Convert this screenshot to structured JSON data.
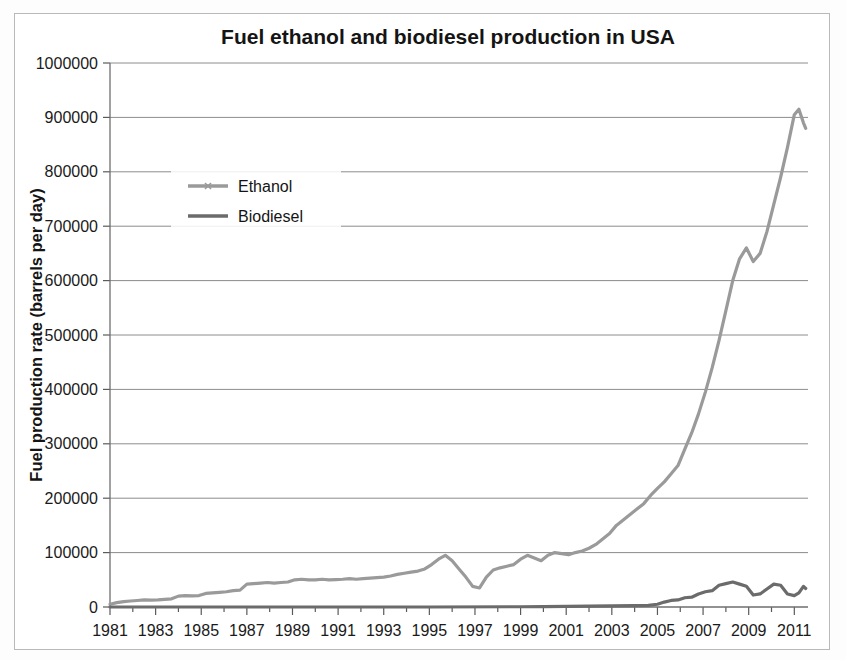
{
  "chart_data": {
    "type": "line",
    "title": "Fuel ethanol and biodiesel production in  USA",
    "xlabel": "",
    "ylabel": "Fuel production rate (barrels per day)",
    "xlim": [
      1981,
      2011.6
    ],
    "ylim": [
      0,
      1000000
    ],
    "grid": true,
    "legend_position": "upper-left-inside",
    "y_ticks": [
      0,
      100000,
      200000,
      300000,
      400000,
      500000,
      600000,
      700000,
      800000,
      900000,
      1000000
    ],
    "y_tick_labels": [
      "0",
      "100000",
      "200000",
      "300000",
      "400000",
      "500000",
      "600000",
      "700000",
      "800000",
      "900000",
      "1000000"
    ],
    "x_ticks": [
      1981,
      1983,
      1985,
      1987,
      1989,
      1991,
      1993,
      1995,
      1997,
      1999,
      2001,
      2003,
      2005,
      2007,
      2009,
      2011
    ],
    "x_tick_labels": [
      "1981",
      "1983",
      "1985",
      "1987",
      "1989",
      "1991",
      "1993",
      "1995",
      "1997",
      "1999",
      "2001",
      "2003",
      "2005",
      "2007",
      "2009",
      "2011"
    ],
    "x_minor_tick_interval": 1,
    "colors": {
      "ethanol": "#9a9a9a",
      "biodiesel": "#6b6b6b",
      "gridline": "#8c8c8c",
      "text": "#141414",
      "background": "#ffffff"
    },
    "series": [
      {
        "name": "Ethanol",
        "color": "#9a9a9a",
        "x": [
          1981.0,
          1981.3,
          1981.6,
          1981.9,
          1982.2,
          1982.5,
          1982.8,
          1983.1,
          1983.4,
          1983.7,
          1984.0,
          1984.3,
          1984.6,
          1984.9,
          1985.2,
          1985.5,
          1985.8,
          1986.1,
          1986.4,
          1986.7,
          1987.0,
          1987.3,
          1987.6,
          1987.9,
          1988.2,
          1988.5,
          1988.8,
          1989.1,
          1989.4,
          1989.7,
          1990.0,
          1990.3,
          1990.6,
          1990.9,
          1991.2,
          1991.5,
          1991.8,
          1992.1,
          1992.4,
          1992.7,
          1993.0,
          1993.3,
          1993.6,
          1993.9,
          1994.2,
          1994.5,
          1994.8,
          1995.1,
          1995.4,
          1995.7,
          1996.0,
          1996.3,
          1996.6,
          1996.9,
          1997.2,
          1997.5,
          1997.8,
          1998.1,
          1998.4,
          1998.7,
          1999.0,
          1999.3,
          1999.6,
          1999.9,
          2000.2,
          2000.5,
          2000.8,
          2001.1,
          2001.4,
          2001.7,
          2002.0,
          2002.3,
          2002.6,
          2002.9,
          2003.2,
          2003.5,
          2003.8,
          2004.1,
          2004.4,
          2004.7,
          2005.0,
          2005.3,
          2005.6,
          2005.9,
          2006.2,
          2006.5,
          2006.8,
          2007.1,
          2007.4,
          2007.7,
          2008.0,
          2008.3,
          2008.6,
          2008.9,
          2009.2,
          2009.5,
          2009.8,
          2010.1,
          2010.4,
          2010.7,
          2011.0,
          2011.2,
          2011.4,
          2011.5
        ],
        "values": [
          5000,
          8000,
          10000,
          11000,
          12000,
          13000,
          12500,
          13000,
          14000,
          15000,
          20000,
          21000,
          20500,
          21000,
          25000,
          26000,
          27000,
          28000,
          30000,
          31000,
          42000,
          43000,
          44000,
          45000,
          44000,
          45000,
          46000,
          50000,
          51000,
          50000,
          50000,
          51000,
          50000,
          50500,
          51000,
          52000,
          51000,
          52000,
          53000,
          54000,
          55000,
          57000,
          60000,
          62000,
          64000,
          66000,
          70000,
          78000,
          88000,
          95000,
          85000,
          70000,
          55000,
          38000,
          35000,
          55000,
          68000,
          72000,
          75000,
          78000,
          88000,
          95000,
          90000,
          85000,
          95000,
          100000,
          98000,
          96000,
          100000,
          103000,
          108000,
          115000,
          125000,
          135000,
          150000,
          160000,
          170000,
          180000,
          190000,
          205000,
          218000,
          230000,
          245000,
          260000,
          290000,
          320000,
          355000,
          395000,
          440000,
          490000,
          545000,
          600000,
          640000,
          660000,
          635000,
          650000,
          690000,
          740000,
          790000,
          845000,
          905000,
          915000,
          890000,
          880000
        ],
        "peak_value": 915000,
        "peak_year": 2011.2,
        "end_value": 880000
      },
      {
        "name": "Biodiesel",
        "color": "#6b6b6b",
        "x": [
          1981.0,
          1985.0,
          1990.0,
          1995.0,
          1999.0,
          2000.0,
          2001.0,
          2002.0,
          2003.0,
          2004.0,
          2004.6,
          2005.0,
          2005.3,
          2005.6,
          2005.9,
          2006.2,
          2006.5,
          2006.8,
          2007.1,
          2007.4,
          2007.7,
          2008.0,
          2008.3,
          2008.6,
          2008.9,
          2009.2,
          2009.5,
          2009.8,
          2010.1,
          2010.4,
          2010.7,
          2011.0,
          2011.2,
          2011.4,
          2011.5
        ],
        "values": [
          0,
          0,
          0,
          0,
          500,
          800,
          1000,
          1500,
          2000,
          2500,
          3000,
          5000,
          9000,
          12000,
          13000,
          17000,
          18000,
          24000,
          28000,
          30000,
          40000,
          43000,
          46000,
          42000,
          38000,
          22000,
          24000,
          33000,
          42000,
          40000,
          24000,
          21000,
          26000,
          38000,
          34000
        ],
        "peak_value": 46000,
        "peak_year": 2008.3,
        "end_value": 34000
      }
    ]
  },
  "legend": {
    "items": [
      {
        "label": "Ethanol"
      },
      {
        "label": "Biodiesel"
      }
    ]
  }
}
